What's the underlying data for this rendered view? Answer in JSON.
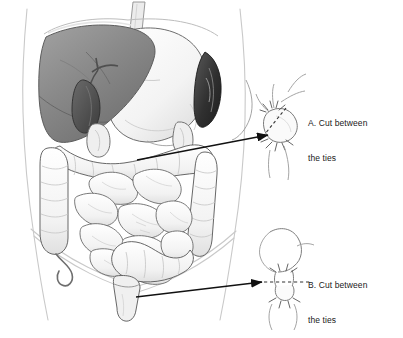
{
  "figure": {
    "background_color": "#ffffff",
    "ink_color": "#2b2b2b",
    "dimensions": {
      "width": 403,
      "height": 338
    }
  },
  "anatomy": {
    "parts": [
      {
        "name": "torso-outline",
        "label": "Torso outline",
        "shade": "#d8d8d8"
      },
      {
        "name": "esophagus",
        "label": "Esophagus",
        "shade": "#e8e8e8"
      },
      {
        "name": "liver",
        "label": "Liver",
        "shade": "#8a8a8a"
      },
      {
        "name": "gallbladder",
        "label": "Gallbladder",
        "shade": "#4a4a4a"
      },
      {
        "name": "stomach",
        "label": "Stomach",
        "shade": "#f4f4f4"
      },
      {
        "name": "spleen",
        "label": "Spleen",
        "shade": "#3a3a3a"
      },
      {
        "name": "duodenum",
        "label": "Duodenum",
        "shade": "#efefef"
      },
      {
        "name": "transverse-colon",
        "label": "Transverse colon",
        "shade": "#f2f2f2"
      },
      {
        "name": "ascending-colon",
        "label": "Ascending colon",
        "shade": "#f2f2f2"
      },
      {
        "name": "descending-colon",
        "label": "Descending colon",
        "shade": "#f2f2f2"
      },
      {
        "name": "small-intestine",
        "label": "Small intestine",
        "shade": "#f6f6f6"
      },
      {
        "name": "appendix",
        "label": "Appendix",
        "shade": "#f4f4f4"
      },
      {
        "name": "sigmoid-colon",
        "label": "Sigmoid colon",
        "shade": "#f2f2f2"
      },
      {
        "name": "rectum",
        "label": "Rectum",
        "shade": "#f0f0f0"
      }
    ]
  },
  "callouts": [
    {
      "id": "a",
      "letter": "A.",
      "text_line1": "A. Cut between",
      "text_line2": "the ties",
      "full_text": "A. Cut between the ties",
      "detail_name": "upper-bowel-tie-detail",
      "arrow_from": {
        "x": 137,
        "y": 160
      },
      "arrow_to": {
        "x": 272,
        "y": 135
      },
      "cut_line_style": "dashed",
      "label_position": {
        "x": 308,
        "y": 95
      }
    },
    {
      "id": "b",
      "letter": "B.",
      "text_line1": "B. Cut between",
      "text_line2": "the ties",
      "full_text": "B. Cut between the ties",
      "detail_name": "sigmoid-tie-detail",
      "arrow_from": {
        "x": 136,
        "y": 297
      },
      "arrow_to": {
        "x": 266,
        "y": 282
      },
      "cut_line_style": "dashed",
      "label_position": {
        "x": 308,
        "y": 257
      }
    }
  ]
}
